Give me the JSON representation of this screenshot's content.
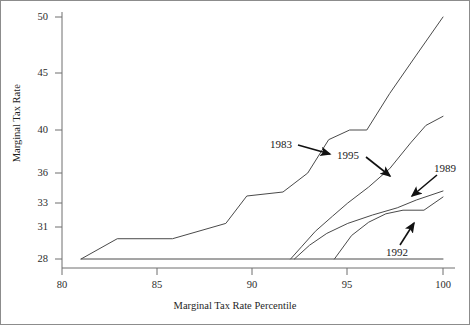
{
  "chart_data": {
    "type": "line",
    "title": "",
    "xlabel": "Marginal Tax Rate Percentile",
    "ylabel": "Marginal Tax Rate",
    "xlim": [
      80,
      100
    ],
    "ylim": [
      28,
      50
    ],
    "grid": false,
    "legend": "inline-annotations",
    "xticks": [
      80,
      85,
      90,
      95,
      100
    ],
    "xtick_labels": [
      "80",
      "85",
      "90",
      "95",
      "100"
    ],
    "yticks": [
      28,
      31,
      33,
      36,
      40,
      45,
      50
    ],
    "ytick_labels": [
      "28",
      "31",
      "33",
      "36",
      "40",
      "45",
      "50"
    ],
    "y_scale_note": "non-linear ordinal spacing between labelled rates",
    "series": [
      {
        "name": "1983",
        "label": "1983",
        "points": [
          [
            81.0,
            28.0
          ],
          [
            82.9,
            29.9
          ],
          [
            85.8,
            29.9
          ],
          [
            88.6,
            31.3
          ],
          [
            89.7,
            33.7
          ],
          [
            91.6,
            34.1
          ],
          [
            92.9,
            36.0
          ],
          [
            94.0,
            39.1
          ],
          [
            95.1,
            40.0
          ],
          [
            96.0,
            40.0
          ],
          [
            97.2,
            43.2
          ],
          [
            98.6,
            46.6
          ],
          [
            100.0,
            50.0
          ]
        ]
      },
      {
        "name": "1995",
        "label": "1995",
        "points": [
          [
            92.0,
            28.0
          ],
          [
            92.6,
            29.2
          ],
          [
            93.3,
            30.6
          ],
          [
            94.2,
            31.9
          ],
          [
            95.0,
            33.0
          ],
          [
            96.1,
            34.6
          ],
          [
            97.2,
            36.4
          ],
          [
            98.3,
            38.8
          ],
          [
            99.1,
            40.4
          ],
          [
            100.0,
            41.2
          ]
        ]
      },
      {
        "name": "1989",
        "label": "1989",
        "points": [
          [
            92.2,
            28.0
          ],
          [
            93.0,
            29.3
          ],
          [
            93.9,
            30.4
          ],
          [
            95.0,
            31.3
          ],
          [
            96.3,
            32.0
          ],
          [
            97.6,
            32.6
          ],
          [
            98.6,
            33.3
          ],
          [
            100.0,
            34.2
          ]
        ]
      },
      {
        "name": "1992",
        "label": "1992",
        "points": [
          [
            94.3,
            28.0
          ],
          [
            95.2,
            30.2
          ],
          [
            96.1,
            31.4
          ],
          [
            97.0,
            32.1
          ],
          [
            97.9,
            32.4
          ],
          [
            99.0,
            32.4
          ],
          [
            100.0,
            33.6
          ]
        ]
      },
      {
        "name": "baseline-28",
        "label": "",
        "points": [
          [
            81.0,
            28.0
          ],
          [
            100.0,
            28.0
          ]
        ]
      }
    ],
    "annotations": [
      {
        "text": "1983",
        "x": 93.2,
        "y": 37.0
      },
      {
        "text": "1995",
        "x": 96.2,
        "y": 35.2
      },
      {
        "text": "1989",
        "x": 99.3,
        "y": 35.3
      },
      {
        "text": "1992",
        "x": 98.4,
        "y": 29.1
      }
    ]
  },
  "axes": {
    "y_label": "Marginal Tax Rate",
    "x_label": "Marginal Tax Rate Percentile"
  },
  "labels": {
    "s1983": "1983",
    "s1995": "1995",
    "s1989": "1989",
    "s1992": "1992"
  },
  "ytick": {
    "t50": "50",
    "t45": "45",
    "t40": "40",
    "t36": "36",
    "t33": "33",
    "t31": "31",
    "t28": "28"
  },
  "xtick": {
    "t80": "80",
    "t85": "85",
    "t90": "90",
    "t95": "95",
    "t100": "100"
  }
}
